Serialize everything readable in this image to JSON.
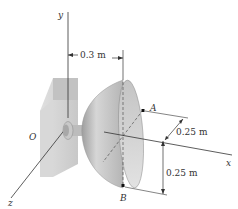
{
  "figure": {
    "type": "engineering-statics-diagram"
  },
  "axes": {
    "x_label": "x",
    "y_label": "y",
    "z_label": "z",
    "origin_label": "O"
  },
  "points": {
    "a_label": "A",
    "b_label": "B"
  },
  "dimensions": {
    "offset_label": "0.3 m",
    "a_offset_label": "0.25 m",
    "b_offset_label": "0.25 m"
  },
  "colors": {
    "line": "#333333",
    "wall_face": "#cfcfcf",
    "wall_side": "#e6e6e6",
    "shell_outer": "#bdbdbd",
    "shell_inner": "#d4d4d4"
  }
}
